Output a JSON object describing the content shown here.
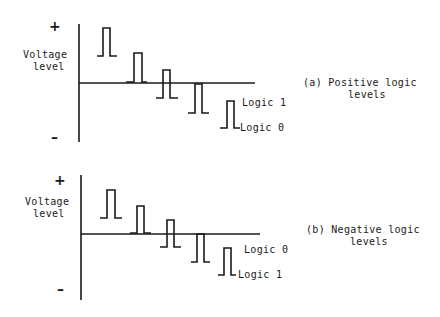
{
  "diagrams": [
    {
      "id": "positive",
      "caption_line1": "(a) Positive logic",
      "caption_line2": "levels",
      "y_axis_label_line1": "Voltage",
      "y_axis_label_line2": "level",
      "plus_sign": "+",
      "minus_sign": "–",
      "legend_upper": "Logic 1",
      "legend_lower": "Logic 0"
    },
    {
      "id": "negative",
      "caption_line1": "(b) Negative logic",
      "caption_line2": "levels",
      "y_axis_label_line1": "Voltage",
      "y_axis_label_line2": "level",
      "plus_sign": "+",
      "minus_sign": "–",
      "legend_upper": "Logic 0",
      "legend_lower": "Logic 1"
    }
  ],
  "colors": {
    "ink": "#1a1a1a",
    "background": "#ffffff"
  }
}
